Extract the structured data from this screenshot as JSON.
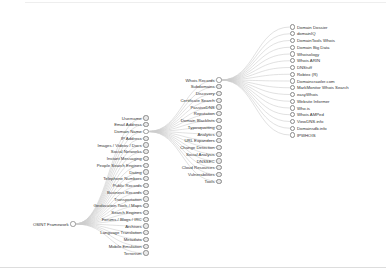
{
  "root": {
    "label": "OSINT Framework"
  },
  "level1": [
    "Username",
    "Email Address",
    "Domain Name",
    "IP Address",
    "Images / Videos / Docs",
    "Social Networks",
    "Instant Messaging",
    "People Search Engines",
    "Dating",
    "Telephone Numbers",
    "Public Records",
    "Business Records",
    "Transportation",
    "Geolocation Tools / Maps",
    "Search Engines",
    "Forums / Blogs / IRC",
    "Archives",
    "Language Translation",
    "Metadata",
    "Mobile Emulation",
    "Terrorism"
  ],
  "level1_expanded": "Domain Name",
  "level2": [
    "Whois Records",
    "Subdomains",
    "Discovery",
    "Certificate Search",
    "PassiveDNS",
    "Reputation",
    "Domain Blacklists",
    "Typosquatting",
    "Analytics",
    "URL Expanders",
    "Change Detection",
    "Social Analysis",
    "DNSSEC",
    "Cloud Resources",
    "Vulnerabilities",
    "Tools"
  ],
  "level2_expanded": "Whois Records",
  "level3": [
    "Domain Dossier",
    "domainIQ",
    "DomainTools Whois",
    "Domain Big Data",
    "Whoisology",
    "Whois ARIN",
    "DNStuff",
    "Robtex (R)",
    "Domaincrawler.com",
    "MarkMonitor Whois Search",
    "easyWhois",
    "Website Informer",
    "Who.is",
    "Whois AMPed",
    "ViewDNS.info",
    "Domainsdb.info",
    "IPWHOIS"
  ],
  "colors": {
    "link": "#cccccc",
    "node_stroke": "#8a8a8a",
    "collapsed_fill": "#e8e8e8",
    "open_fill": "#ffffff",
    "text": "#333333"
  }
}
